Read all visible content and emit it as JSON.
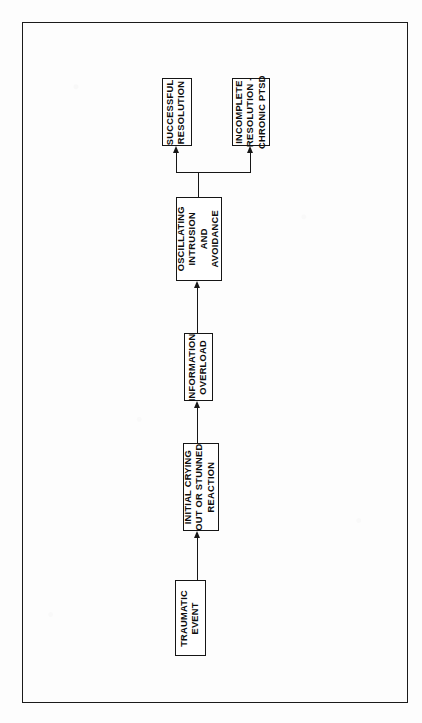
{
  "diagram": {
    "orientation": "vertical-bottom-to-top",
    "text_rotation": "-90deg",
    "frame": {
      "visible": true,
      "color": "#1b1b1b"
    },
    "colors": {
      "background": "#fdfdfd",
      "box_fill": "#ffffff",
      "box_stroke": "#151515",
      "connector": "#161616",
      "text": "#0d0d0d"
    },
    "nodes": [
      {
        "id": "traumatic-event",
        "lines": [
          "TRAUMATIC",
          "EVENT"
        ],
        "x": 175,
        "y": 580,
        "w": 31,
        "h": 76
      },
      {
        "id": "initial-crying-out",
        "lines": [
          "INITIAL CRYING",
          "OUT OR STUNNED",
          "REACTION"
        ],
        "x": 183,
        "y": 443,
        "w": 36,
        "h": 88
      },
      {
        "id": "information-overload",
        "lines": [
          "INFORMATION",
          "OVERLOAD"
        ],
        "x": 184,
        "y": 333,
        "w": 29,
        "h": 68
      },
      {
        "id": "oscillating-intrusion-avoidance",
        "lines": [
          "OSCILLATING",
          "INTRUSION",
          "AND",
          "AVOIDANCE"
        ],
        "x": 176,
        "y": 197,
        "w": 46,
        "h": 84
      },
      {
        "id": "successful-resolution",
        "lines": [
          "SUCCESSFUL",
          "RESOLUTION"
        ],
        "x": 162,
        "y": 78,
        "w": 30,
        "h": 68
      },
      {
        "id": "incomplete-resolution",
        "lines": [
          "INCOMPLETE",
          "RESOLUTION -",
          "CHRONIC PTSD"
        ],
        "x": 232,
        "y": 78,
        "w": 38,
        "h": 68
      }
    ],
    "edges": [
      {
        "id": "edge-event-to-crying",
        "from": "traumatic-event",
        "to": "initial-crying-out",
        "type": "straight-up"
      },
      {
        "id": "edge-crying-to-overload",
        "from": "initial-crying-out",
        "to": "information-overload",
        "type": "straight-up"
      },
      {
        "id": "edge-overload-to-oscillating",
        "from": "information-overload",
        "to": "oscillating-intrusion-avoidance",
        "type": "straight-up"
      },
      {
        "id": "edge-oscillating-to-successful",
        "from": "oscillating-intrusion-avoidance",
        "to": "successful-resolution",
        "type": "branch-left"
      },
      {
        "id": "edge-oscillating-to-incomplete",
        "from": "oscillating-intrusion-avoidance",
        "to": "incomplete-resolution",
        "type": "branch-right"
      }
    ]
  }
}
